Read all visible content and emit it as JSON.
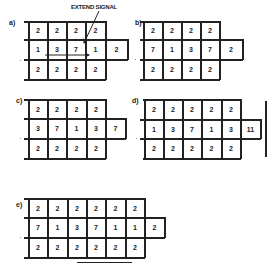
{
  "annotation": {
    "text": "EXTEND SIGNAL"
  },
  "panels": [
    {
      "label": "a)",
      "rows": [
        [
          "2",
          "2",
          "2",
          "2"
        ],
        [
          "1",
          "3",
          "7",
          "1",
          "2"
        ],
        [
          "2",
          "2",
          "2",
          "2"
        ]
      ]
    },
    {
      "label": "b)",
      "rows": [
        [
          "2",
          "2",
          "2",
          "2"
        ],
        [
          "7",
          "1",
          "3",
          "7",
          "2"
        ],
        [
          "2",
          "2",
          "2",
          "2"
        ]
      ]
    },
    {
      "label": "c)",
      "rows": [
        [
          "2",
          "2",
          "2",
          "2"
        ],
        [
          "3",
          "7",
          "1",
          "3",
          "7"
        ],
        [
          "2",
          "2",
          "2",
          "2"
        ]
      ]
    },
    {
      "label": "d)",
      "rows": [
        [
          "2",
          "2",
          "2",
          "2",
          "2"
        ],
        [
          "1",
          "3",
          "7",
          "1",
          "3",
          "11"
        ],
        [
          "2",
          "2",
          "2",
          "2",
          "2"
        ]
      ]
    },
    {
      "label": "e)",
      "rows": [
        [
          "2",
          "2",
          "2",
          "2",
          "2",
          "2"
        ],
        [
          "7",
          "1",
          "3",
          "7",
          "1",
          "1",
          "2"
        ],
        [
          "2",
          "2",
          "2",
          "2",
          "2",
          "2"
        ]
      ]
    }
  ]
}
